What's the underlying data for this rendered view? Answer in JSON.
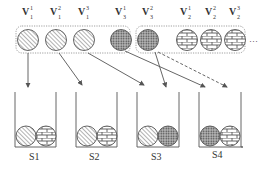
{
  "diagram": {
    "top_labels": [
      {
        "base": "V",
        "sup": "1",
        "sub": "1",
        "x": 28
      },
      {
        "base": "V",
        "sup": "2",
        "sub": "1",
        "x": 56
      },
      {
        "base": "V",
        "sup": "3",
        "sub": "1",
        "x": 84
      },
      {
        "base": "V",
        "sup": "1",
        "sub": "3",
        "x": 121
      },
      {
        "base": "V",
        "sup": "2",
        "sub": "3",
        "x": 148
      },
      {
        "base": "V",
        "sup": "1",
        "sub": "2",
        "x": 187
      },
      {
        "base": "V",
        "sup": "2",
        "sub": "2",
        "x": 211
      },
      {
        "base": "V",
        "sup": "3",
        "sub": "2",
        "x": 235
      }
    ],
    "ellipsis": "···",
    "bins": [
      {
        "label": "S1",
        "x": 15,
        "contents": [
          "hatched",
          "brick"
        ]
      },
      {
        "label": "S2",
        "x": 76,
        "contents": [
          "hatched",
          "brick"
        ]
      },
      {
        "label": "S3",
        "x": 137,
        "contents": [
          "hatched",
          "dotted"
        ]
      },
      {
        "label": "S4",
        "x": 199,
        "contents": [
          "dotted",
          "brick"
        ]
      }
    ],
    "colors": {
      "stroke": "#555555",
      "dashed_box": "#888888"
    }
  }
}
